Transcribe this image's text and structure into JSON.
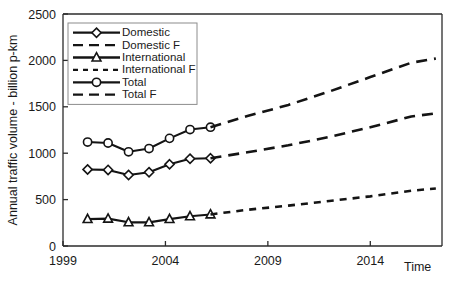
{
  "chart_data": {
    "type": "line",
    "title": "",
    "xlabel": "Time",
    "ylabel": "Annual traffic volume - billion p-km",
    "xlim": [
      1999,
      2017.5
    ],
    "ylim": [
      0,
      2500
    ],
    "grid": false,
    "legend_position": "top-left",
    "x_ticks": [
      "1999",
      "2004",
      "2009",
      "2014"
    ],
    "x_tick_values": [
      1999,
      2004,
      2009,
      2014
    ],
    "y_ticks": [
      "0",
      "500",
      "1000",
      "1500",
      "2000",
      "2500"
    ],
    "y_tick_values": [
      0,
      500,
      1000,
      1500,
      2000,
      2500
    ],
    "series": [
      {
        "name": "Domestic",
        "style": "solid",
        "marker": "diamond",
        "x": [
          2000.2,
          2001.2,
          2002.2,
          2003.2,
          2004.2,
          2005.2,
          2006.2
        ],
        "values": [
          825,
          820,
          765,
          795,
          880,
          940,
          945
        ]
      },
      {
        "name": "Domestic F",
        "style": "long-dash",
        "marker": "none",
        "x": [
          2006.2,
          2008,
          2010,
          2012,
          2014,
          2016,
          2017.2
        ],
        "values": [
          945,
          1010,
          1085,
          1175,
          1280,
          1395,
          1430
        ]
      },
      {
        "name": "International",
        "style": "solid",
        "marker": "triangle",
        "x": [
          2000.2,
          2001.2,
          2002.2,
          2003.2,
          2004.2,
          2005.2,
          2006.2
        ],
        "values": [
          290,
          295,
          255,
          255,
          290,
          320,
          340
        ]
      },
      {
        "name": "International F",
        "style": "short-dash",
        "marker": "none",
        "x": [
          2006.2,
          2008,
          2010,
          2012,
          2014,
          2016,
          2017.2
        ],
        "values": [
          340,
          390,
          435,
          485,
          535,
          595,
          620
        ]
      },
      {
        "name": "Total",
        "style": "solid",
        "marker": "circle",
        "x": [
          2000.2,
          2001.2,
          2002.2,
          2003.2,
          2004.2,
          2005.2,
          2006.2
        ],
        "values": [
          1120,
          1110,
          1015,
          1050,
          1160,
          1255,
          1280
        ]
      },
      {
        "name": "Total F",
        "style": "long-dash",
        "marker": "none",
        "x": [
          2006.2,
          2008,
          2010,
          2012,
          2014,
          2016,
          2017.2
        ],
        "values": [
          1280,
          1400,
          1520,
          1665,
          1820,
          1975,
          2020
        ]
      }
    ]
  },
  "axes": {
    "y_title": "Annual traffic volume - billion p-km",
    "x_title": "Time"
  },
  "legend": {
    "items": [
      {
        "label": "Domestic",
        "style": "solid",
        "marker": "diamond"
      },
      {
        "label": "Domestic F",
        "style": "long-dash",
        "marker": "none"
      },
      {
        "label": "International",
        "style": "solid",
        "marker": "triangle"
      },
      {
        "label": "International F",
        "style": "short-dash",
        "marker": "none"
      },
      {
        "label": "Total",
        "style": "solid",
        "marker": "circle"
      },
      {
        "label": "Total F",
        "style": "long-dash",
        "marker": "none"
      }
    ]
  },
  "colors": {
    "line": "#141414",
    "axis": "#2b2b2b",
    "legend_border": "#8c8c8c",
    "background": "#ffffff",
    "marker_fill": "#ffffff"
  }
}
